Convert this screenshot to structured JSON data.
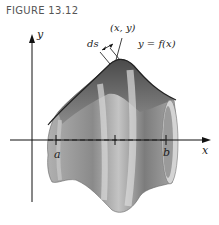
{
  "caption": "FIGURE 13.12",
  "labels": {
    "y_axis": "y",
    "x_axis": "x",
    "point": "(x, y)",
    "arc_length": "ds",
    "curve": "y = f(x)",
    "a": "a",
    "b": "b"
  },
  "colors": {
    "surface_dark": "#5a5a5a",
    "surface_mid": "#8c8c8c",
    "surface_light": "#c8c8c8",
    "axis": "#111111"
  }
}
